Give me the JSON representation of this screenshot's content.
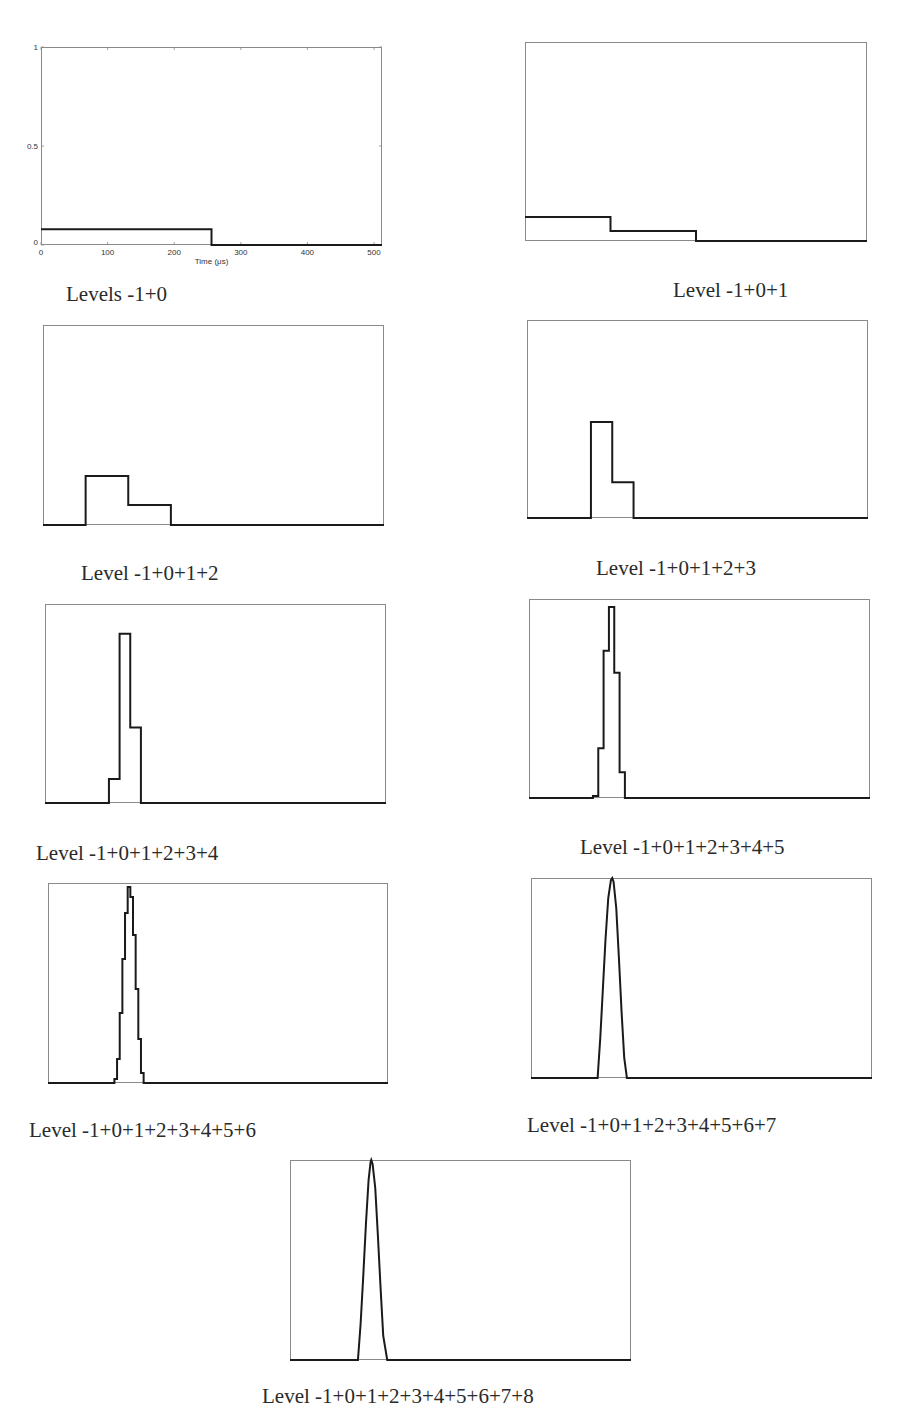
{
  "chart_data": [
    {
      "type": "line",
      "title": "Levels -1+0",
      "xlabel": "Time (μs)",
      "ylabel": "",
      "xlim": [
        0,
        512
      ],
      "ylim": [
        0,
        1
      ],
      "xticks": [
        "0",
        "100",
        "200",
        "300",
        "400",
        "500"
      ],
      "yticks": [
        "0",
        "0.5",
        "1"
      ],
      "show_axes_labels": true,
      "box": {
        "x": 41,
        "y": 47,
        "w": 341,
        "h": 198
      },
      "caption_pos": {
        "x": 66,
        "y": 282
      },
      "x": [
        0,
        256,
        256,
        512
      ],
      "y": [
        0.08,
        0.08,
        0,
        0
      ]
    },
    {
      "type": "line",
      "title": "Level -1+0+1",
      "xlim": [
        0,
        512
      ],
      "ylim": [
        0,
        1
      ],
      "box": {
        "x": 525,
        "y": 42,
        "w": 342,
        "h": 199
      },
      "caption_pos": {
        "x": 673,
        "y": 278
      },
      "x": [
        0,
        128,
        128,
        256,
        256,
        512
      ],
      "y": [
        0.12,
        0.12,
        0.05,
        0.05,
        0,
        0
      ]
    },
    {
      "type": "line",
      "title": "Level -1+0+1+2",
      "xlim": [
        0,
        512
      ],
      "ylim": [
        0,
        1
      ],
      "box": {
        "x": 43,
        "y": 325,
        "w": 341,
        "h": 200
      },
      "caption_pos": {
        "x": 81,
        "y": 561
      },
      "x": [
        0,
        64,
        64,
        128,
        128,
        192,
        192,
        512
      ],
      "y": [
        0,
        0,
        0.245,
        0.245,
        0.1,
        0.1,
        0,
        0
      ]
    },
    {
      "type": "line",
      "title": "Level -1+0+1+2+3",
      "xlim": [
        0,
        512
      ],
      "ylim": [
        0,
        1
      ],
      "box": {
        "x": 527,
        "y": 320,
        "w": 341,
        "h": 198
      },
      "caption_pos": {
        "x": 596,
        "y": 556
      },
      "x": [
        0,
        96,
        96,
        128,
        128,
        160,
        160,
        512
      ],
      "y": [
        0,
        0,
        0.485,
        0.485,
        0.18,
        0.18,
        0,
        0
      ]
    },
    {
      "type": "line",
      "title": "Level -1+0+1+2+3+4",
      "xlim": [
        0,
        512
      ],
      "ylim": [
        0,
        1
      ],
      "box": {
        "x": 45,
        "y": 604,
        "w": 341,
        "h": 199
      },
      "caption_pos": {
        "x": 36,
        "y": 841
      },
      "x": [
        0,
        96,
        96,
        112,
        112,
        128,
        128,
        144,
        144,
        512
      ],
      "y": [
        0,
        0,
        0.12,
        0.12,
        0.85,
        0.85,
        0.38,
        0.38,
        0,
        0
      ]
    },
    {
      "type": "line",
      "title": "Level -1+0+1+2+3+4+5",
      "xlim": [
        0,
        512
      ],
      "ylim": [
        0,
        1
      ],
      "box": {
        "x": 529,
        "y": 599,
        "w": 341,
        "h": 199
      },
      "caption_pos": {
        "x": 580,
        "y": 835
      },
      "x": [
        0,
        96,
        96,
        104,
        104,
        112,
        112,
        120,
        120,
        128,
        128,
        136,
        136,
        144,
        144,
        512
      ],
      "y": [
        0,
        0,
        0.01,
        0.01,
        0.25,
        0.25,
        0.74,
        0.74,
        0.96,
        0.96,
        0.63,
        0.63,
        0.13,
        0.13,
        0,
        0
      ]
    },
    {
      "type": "line",
      "title": "Level -1+0+1+2+3+4+5+6",
      "xlim": [
        0,
        512
      ],
      "ylim": [
        0,
        1
      ],
      "box": {
        "x": 48,
        "y": 883,
        "w": 340,
        "h": 200
      },
      "caption_pos": {
        "x": 29,
        "y": 1118
      },
      "x": [
        0,
        100,
        100,
        104,
        104,
        108,
        108,
        112,
        112,
        116,
        116,
        120,
        120,
        124,
        124,
        128,
        128,
        132,
        132,
        136,
        136,
        140,
        140,
        144,
        144,
        512
      ],
      "y": [
        0,
        0,
        0.02,
        0.02,
        0.12,
        0.12,
        0.35,
        0.35,
        0.62,
        0.62,
        0.85,
        0.85,
        0.98,
        0.98,
        0.93,
        0.93,
        0.74,
        0.74,
        0.47,
        0.47,
        0.22,
        0.22,
        0.05,
        0.05,
        0,
        0
      ]
    },
    {
      "type": "line",
      "title": "Level -1+0+1+2+3+4+5+6+7",
      "xlim": [
        0,
        512
      ],
      "ylim": [
        0,
        1
      ],
      "box": {
        "x": 531,
        "y": 878,
        "w": 341,
        "h": 200
      },
      "caption_pos": {
        "x": 527,
        "y": 1113
      },
      "x": [
        0,
        100,
        104,
        108,
        112,
        116,
        120,
        122,
        124,
        128,
        132,
        136,
        140,
        144,
        512
      ],
      "y": [
        0,
        0,
        0.2,
        0.45,
        0.7,
        0.9,
        0.99,
        1.0,
        0.98,
        0.85,
        0.6,
        0.33,
        0.1,
        0,
        0
      ]
    },
    {
      "type": "line",
      "title": "Level -1+0+1+2+3+4+5+6+7+8",
      "xlim": [
        0,
        512
      ],
      "ylim": [
        0,
        1
      ],
      "box": {
        "x": 290,
        "y": 1160,
        "w": 341,
        "h": 200
      },
      "caption_pos": {
        "x": 262,
        "y": 1384
      },
      "x": [
        0,
        102,
        106,
        110,
        114,
        118,
        121,
        122,
        124,
        128,
        132,
        136,
        140,
        146,
        512
      ],
      "y": [
        0,
        0,
        0.18,
        0.42,
        0.68,
        0.9,
        0.99,
        1.0,
        0.98,
        0.86,
        0.62,
        0.36,
        0.12,
        0,
        0
      ]
    }
  ],
  "captions": [
    "Levels -1+0",
    "Level -1+0+1",
    "Level -1+0+1+2",
    "Level -1+0+1+2+3",
    "Level -1+0+1+2+3+4",
    "Level -1+0+1+2+3+4+5",
    "Level -1+0+1+2+3+4+5+6",
    "Level -1+0+1+2+3+4+5+6+7",
    "Level -1+0+1+2+3+4+5+6+7+8"
  ],
  "axis": {
    "xlabel": "Time (μs)",
    "xticks": [
      "0",
      "100",
      "200",
      "300",
      "400",
      "500"
    ],
    "yticks": [
      "0",
      "0.5",
      "1"
    ]
  },
  "colors": {
    "line": "#1a1a1a",
    "frame": "#8a8a8a",
    "text": "#2a2a2a"
  }
}
